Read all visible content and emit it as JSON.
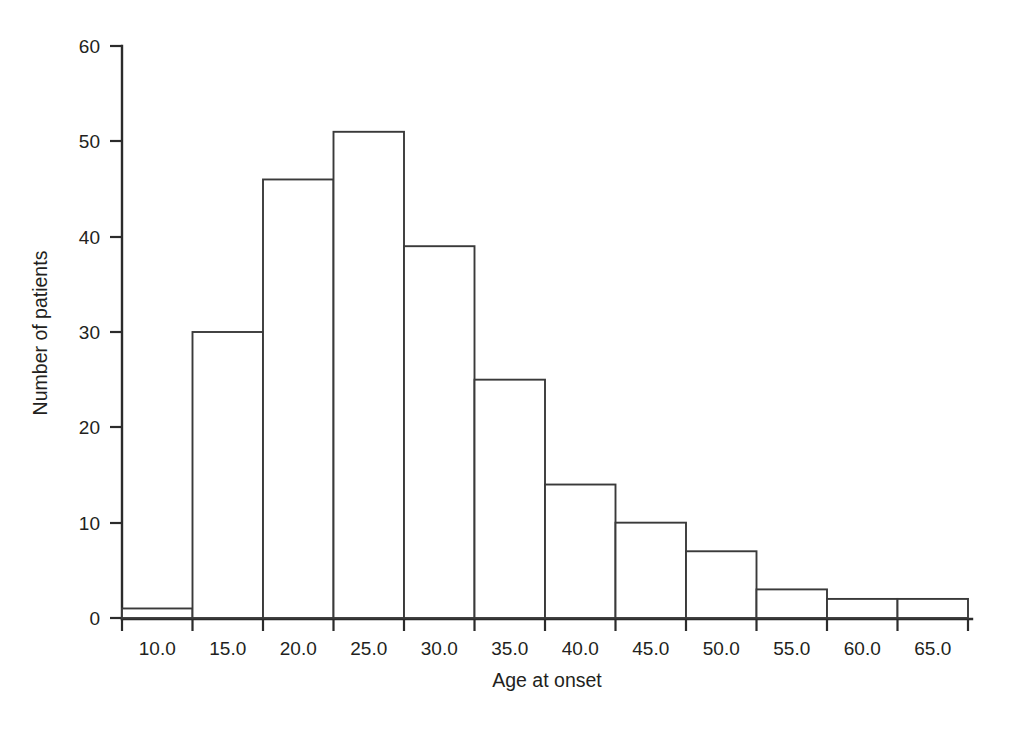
{
  "chart_data": {
    "type": "bar",
    "title": "",
    "subtitle": "",
    "xlabel": "Age at onset",
    "ylabel": "Number of patients",
    "categories": [
      "10.0",
      "15.0",
      "20.0",
      "25.0",
      "30.0",
      "35.0",
      "40.0",
      "45.0",
      "50.0",
      "55.0",
      "60.0",
      "65.0"
    ],
    "values": [
      1,
      30,
      46,
      51,
      39,
      25,
      14,
      10,
      7,
      3,
      2,
      2
    ],
    "bin_edges": [
      7.5,
      12.5,
      17.5,
      22.5,
      27.5,
      32.5,
      37.5,
      42.5,
      47.5,
      52.5,
      57.5,
      62.5,
      67.5
    ],
    "bin_width": 5,
    "xlim": [
      7.5,
      67.5
    ],
    "ylim": [
      0,
      60
    ],
    "xtick_labels": [
      "10.0",
      "15.0",
      "20.0",
      "25.0",
      "30.0",
      "35.0",
      "40.0",
      "45.0",
      "50.0",
      "55.0",
      "60.0",
      "65.0"
    ],
    "ytick_labels": [
      "0",
      "10",
      "20",
      "30",
      "40",
      "50",
      "60"
    ],
    "ytick_values": [
      0,
      10,
      20,
      30,
      40,
      50,
      60
    ],
    "grid": false,
    "legend": false,
    "legend_position": "none",
    "bar_fill_color": "#ffffff",
    "bar_edge_color": "#3a3a3a",
    "axis_color": "#2b2b2b",
    "text_color": "#231f20",
    "background_color": "#ffffff",
    "annotations": []
  }
}
